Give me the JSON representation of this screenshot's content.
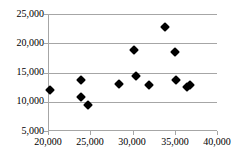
{
  "chart_data": {
    "type": "scatter",
    "title": "",
    "subtitle": "",
    "xlabel": "",
    "ylabel": "",
    "xlim": [
      20000,
      40000
    ],
    "ylim": [
      5000,
      25000
    ],
    "x_ticks": [
      20000,
      25000,
      30000,
      35000,
      40000
    ],
    "y_ticks": [
      5000,
      10000,
      15000,
      20000,
      25000
    ],
    "x_tick_labels": [
      "20,000",
      "25,000",
      "30,000",
      "35,000",
      "40,000"
    ],
    "y_tick_labels": [
      "5,000",
      "10,000",
      "15,000",
      "20,000",
      "25,000"
    ],
    "grid": "horizontal",
    "legend": "none",
    "marker": "diamond",
    "marker_color": "#000000",
    "grid_color": "#a6a6a6",
    "axis_color": "#a6a6a6",
    "background": "#ffffff",
    "series": [
      {
        "name": "Series 1",
        "points": [
          {
            "x": 20200,
            "y": 11950
          },
          {
            "x": 23950,
            "y": 13700
          },
          {
            "x": 23950,
            "y": 10800
          },
          {
            "x": 24700,
            "y": 9400
          },
          {
            "x": 28450,
            "y": 13000
          },
          {
            "x": 30200,
            "y": 18850
          },
          {
            "x": 30400,
            "y": 14350
          },
          {
            "x": 31900,
            "y": 12850
          },
          {
            "x": 33900,
            "y": 22700
          },
          {
            "x": 35000,
            "y": 18550
          },
          {
            "x": 35200,
            "y": 13700
          },
          {
            "x": 36500,
            "y": 12500
          },
          {
            "x": 36800,
            "y": 12900
          }
        ]
      }
    ]
  }
}
